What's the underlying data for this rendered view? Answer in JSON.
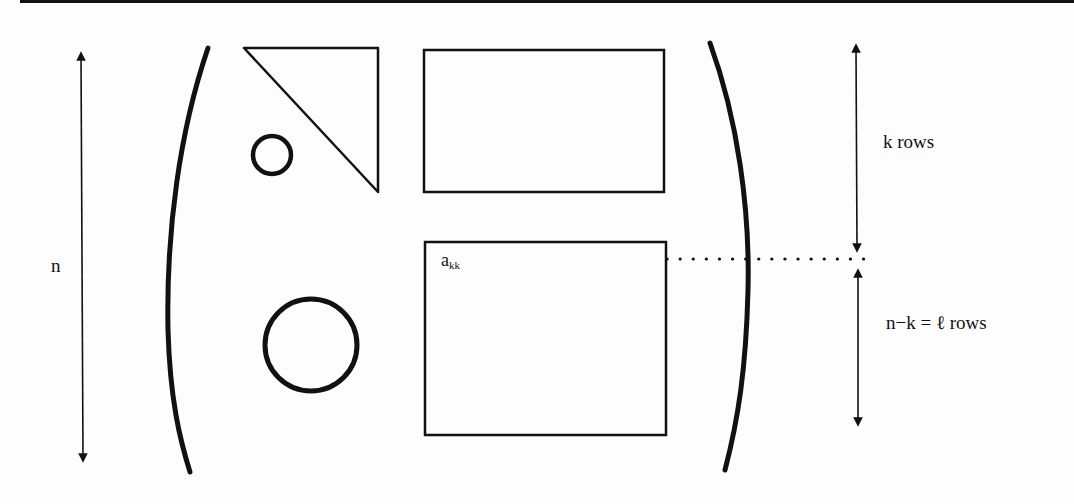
{
  "diagram": {
    "labels": {
      "n": "n",
      "pivot_base": "a",
      "pivot_sub": "kk",
      "upper_rows": "k rows",
      "lower_rows": "n−k = ℓ rows"
    },
    "shapes": {
      "left_paren": "(",
      "right_paren": ")",
      "small_circle": "small circle",
      "large_circle": "large circle",
      "triangle": "upper triangle",
      "upper_block": "upper right block",
      "lower_block": "lower right block"
    },
    "colors": {
      "ink": "#111111",
      "paper": "#fdfdfd"
    }
  }
}
